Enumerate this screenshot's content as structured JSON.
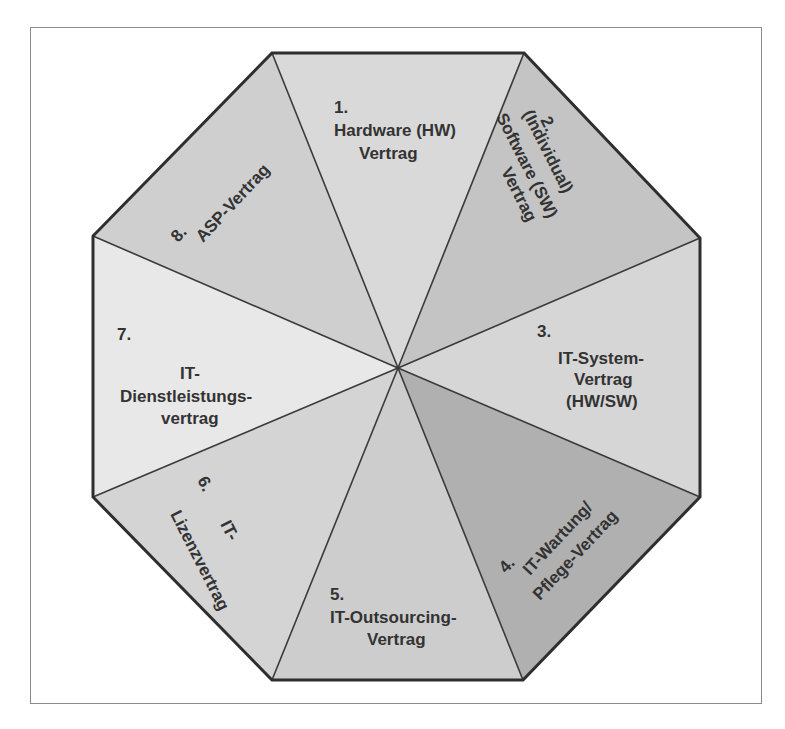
{
  "diagram": {
    "type": "octagon-segments",
    "center": [
      398,
      368
    ],
    "colors": {
      "outline": "#2e2e2e",
      "divider": "#3a3a3a",
      "frame": "#8a8a8a",
      "text": "#333333"
    },
    "segments": [
      {
        "id": 1,
        "number": "1.",
        "lines": [
          "Hardware (HW)",
          "Vertrag"
        ],
        "fill": "#d9d9d9"
      },
      {
        "id": 2,
        "number": "2.",
        "lines": [
          "(Individual)",
          "Software (SW)",
          "Vertrag"
        ],
        "fill": "#c4c4c4"
      },
      {
        "id": 3,
        "number": "3.",
        "lines": [
          "IT-System-",
          "Vertrag",
          "(HW/SW)"
        ],
        "fill": "#d6d6d6"
      },
      {
        "id": 4,
        "number": "4.",
        "lines": [
          "IT-Wartung/",
          "Pflege-Vertrag"
        ],
        "fill": "#b0b0b0"
      },
      {
        "id": 5,
        "number": "5.",
        "lines": [
          "IT-Outsourcing-",
          "Vertrag"
        ],
        "fill": "#cdcdcd"
      },
      {
        "id": 6,
        "number": "6.",
        "lines": [
          "IT-",
          "Lizenzvertrag"
        ],
        "fill": "#d4d4d4"
      },
      {
        "id": 7,
        "number": "7.",
        "lines": [
          "IT-",
          "Dienstleistungs-",
          "vertrag"
        ],
        "fill": "#e8e8e8"
      },
      {
        "id": 8,
        "number": "8.",
        "lines": [
          "ASP-Vertrag"
        ],
        "fill": "#cfcfcf"
      }
    ]
  }
}
